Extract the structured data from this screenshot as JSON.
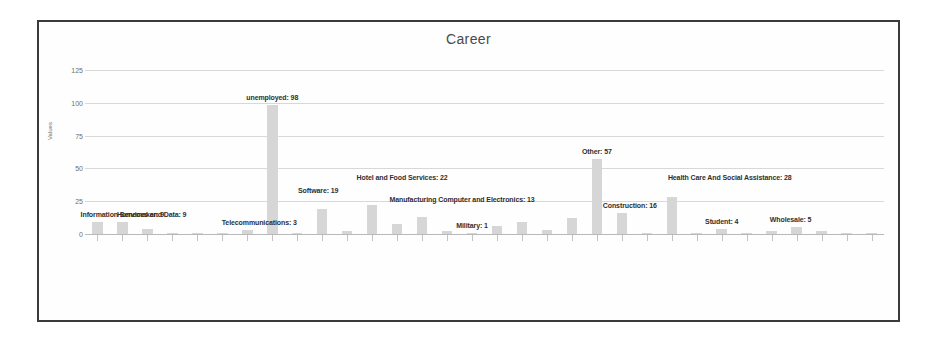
{
  "chart_data": {
    "type": "bar",
    "title": "Career",
    "xlabel": "",
    "ylabel": "Values",
    "ylim": [
      0,
      125
    ],
    "yticks": [
      0,
      25,
      50,
      75,
      100,
      125
    ],
    "grid": true,
    "legend": false,
    "bar_color": "#d6d6d6",
    "categories": [
      "Information Services and Data",
      "Homemaker",
      "Retail",
      "Education",
      "Transportation",
      "Finance",
      "Telecommunications",
      "unemployed",
      "Legal",
      "Software",
      "Agriculture",
      "Hotel and Food Services",
      "Arts and Entertainment",
      "Manufacturing Computer and Electronics",
      "Real Estate",
      "Military",
      "Insurance",
      "Utilities",
      "Non-Profit",
      "Publishing",
      "Other",
      "Construction",
      "Consulting",
      "Health Care And Social Assistance",
      "Automotive",
      "Student",
      "Pharmaceutical",
      "Scientific",
      "Wholesale",
      "Mining",
      "Religious",
      "Government"
    ],
    "values": [
      9,
      9,
      4,
      1,
      1,
      1,
      3,
      98,
      1,
      19,
      2,
      22,
      8,
      13,
      2,
      1,
      6,
      9,
      3,
      12,
      57,
      16,
      1,
      28,
      1,
      4,
      1,
      2,
      5,
      2,
      1,
      1
    ],
    "annotations": [
      {
        "label": "Information Services and Data: 9",
        "index": 0
      },
      {
        "label": "Homemaker: 9",
        "index": 1
      },
      {
        "label": "Telecommunications: 3",
        "index": 6
      },
      {
        "label": "unemployed: 98",
        "index": 7
      },
      {
        "label": "Software: 19",
        "index": 9
      },
      {
        "label": "Hotel and Food Services: 22",
        "index": 11
      },
      {
        "label": "Manufacturing Computer and Electronics: 13",
        "index": 13
      },
      {
        "label": "Military: 1",
        "index": 15
      },
      {
        "label": "Other: 57",
        "index": 20
      },
      {
        "label": "Construction: 16",
        "index": 21
      },
      {
        "label": "Health Care And Social Assistance: 28",
        "index": 23
      },
      {
        "label": "Student: 4",
        "index": 25
      },
      {
        "label": "Wholesale: 5",
        "index": 28
      }
    ]
  }
}
